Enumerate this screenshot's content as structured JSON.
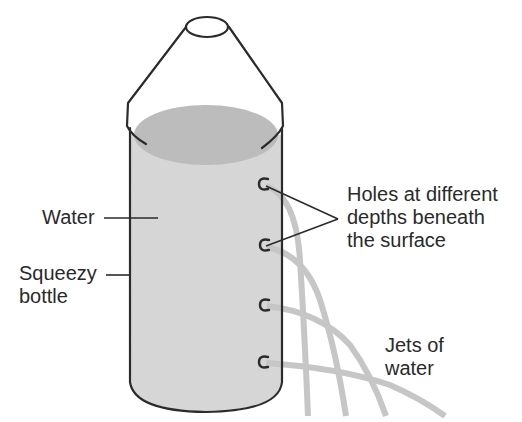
{
  "diagram": {
    "colors": {
      "outline": "#2b2b2b",
      "water_fill": "#d6d6d6",
      "water_surface": "#bdbdbd",
      "jet": "#c4c4c4",
      "text": "#2a2a2a",
      "background": "#ffffff"
    },
    "labels": {
      "water": "Water",
      "squeezy_line1": "Squeezy",
      "squeezy_line2": "bottle",
      "holes_line1": "Holes at different",
      "holes_line2": "depths beneath",
      "holes_line3": "the surface",
      "jets_line1": "Jets of",
      "jets_line2": "water"
    },
    "holes": [
      {
        "id": 1,
        "x": 262,
        "y": 184
      },
      {
        "id": 2,
        "x": 263,
        "y": 245
      },
      {
        "id": 3,
        "x": 263,
        "y": 305
      },
      {
        "id": 4,
        "x": 262,
        "y": 362
      }
    ],
    "jets": [
      {
        "from_hole": 1,
        "end_x": 308
      },
      {
        "from_hole": 2,
        "end_x": 346
      },
      {
        "from_hole": 3,
        "end_x": 386
      },
      {
        "from_hole": 4,
        "end_x": 445
      }
    ]
  }
}
